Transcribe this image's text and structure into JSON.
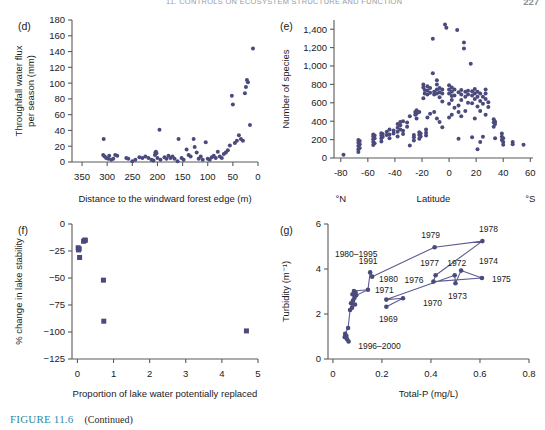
{
  "page": {
    "running_head": "11. CONTROLS ON ECOSYSTEM STRUCTURE AND FUNCTION",
    "page_number": "227"
  },
  "caption": {
    "figure_number": "FIGURE 11.6",
    "text": "(Continued)"
  },
  "style": {
    "marker_color": "#4a4a7d",
    "line_color": "#5b5b93",
    "axis_color": "#5a5a5a",
    "text_color": "#1a1a1a",
    "caption_accent": "#2d8aa8"
  },
  "chart_data": [
    {
      "id": "d",
      "panel_label": "(d)",
      "type": "scatter",
      "title": "",
      "xlabel": "Distance to the windward forest edge (m)",
      "ylabel": "Throughfall water flux per season (mm)",
      "ylabel_lines": [
        "Throughfall water flux",
        "per season (mm)"
      ],
      "xlim": [
        370,
        0
      ],
      "ylim": [
        0,
        180
      ],
      "x_reversed": true,
      "xticks": [
        350,
        300,
        250,
        200,
        150,
        100,
        50,
        0
      ],
      "yticks": [
        0,
        20,
        40,
        60,
        80,
        100,
        120,
        140,
        160,
        180
      ],
      "grid": false,
      "points": [
        [
          307,
          29
        ],
        [
          308,
          9
        ],
        [
          305,
          7
        ],
        [
          302,
          5
        ],
        [
          298,
          4
        ],
        [
          296,
          8
        ],
        [
          292,
          3
        ],
        [
          288,
          4
        ],
        [
          284,
          9
        ],
        [
          280,
          8
        ],
        [
          262,
          5
        ],
        [
          258,
          4
        ],
        [
          250,
          1
        ],
        [
          244,
          3
        ],
        [
          236,
          6
        ],
        [
          230,
          5
        ],
        [
          224,
          7
        ],
        [
          218,
          5
        ],
        [
          212,
          3
        ],
        [
          208,
          2
        ],
        [
          205,
          9
        ],
        [
          204,
          12
        ],
        [
          203,
          13
        ],
        [
          202,
          11
        ],
        [
          200,
          5
        ],
        [
          196,
          41
        ],
        [
          194,
          3
        ],
        [
          186,
          6
        ],
        [
          182,
          4
        ],
        [
          178,
          8
        ],
        [
          174,
          5
        ],
        [
          170,
          7
        ],
        [
          166,
          4
        ],
        [
          160,
          1
        ],
        [
          158,
          29
        ],
        [
          152,
          5
        ],
        [
          148,
          3
        ],
        [
          142,
          16
        ],
        [
          138,
          9
        ],
        [
          134,
          7
        ],
        [
          128,
          29
        ],
        [
          126,
          19
        ],
        [
          122,
          12
        ],
        [
          118,
          4
        ],
        [
          114,
          7
        ],
        [
          110,
          3
        ],
        [
          104,
          25
        ],
        [
          100,
          4
        ],
        [
          96,
          3
        ],
        [
          92,
          6
        ],
        [
          88,
          8
        ],
        [
          84,
          5
        ],
        [
          80,
          13
        ],
        [
          76,
          7
        ],
        [
          72,
          5
        ],
        [
          68,
          10
        ],
        [
          64,
          12
        ],
        [
          60,
          15
        ],
        [
          56,
          21
        ],
        [
          52,
          84
        ],
        [
          50,
          73
        ],
        [
          46,
          24
        ],
        [
          42,
          27
        ],
        [
          38,
          34
        ],
        [
          34,
          29
        ],
        [
          30,
          27
        ],
        [
          26,
          87
        ],
        [
          24,
          95
        ],
        [
          22,
          104
        ],
        [
          20,
          101
        ],
        [
          16,
          47
        ],
        [
          10,
          144
        ]
      ]
    },
    {
      "id": "e",
      "panel_label": "(e)",
      "type": "scatter",
      "title": "",
      "xlabel": "Latitude",
      "ylabel": "Number of species",
      "xlabel_left": "°N",
      "xlabel_right": "°S",
      "xlim": [
        -85,
        62
      ],
      "ylim": [
        0,
        1500
      ],
      "xticks": [
        -80,
        -60,
        -40,
        -20,
        0,
        20,
        40,
        60
      ],
      "yticks": [
        0,
        200,
        400,
        600,
        800,
        1000,
        1200,
        1400
      ],
      "ytick_labels": [
        "0",
        "200",
        "400",
        "600",
        "800",
        "1,000",
        "1,200",
        "1,400"
      ],
      "grid": false,
      "points": [
        [
          -78,
          35
        ],
        [
          -67,
          65
        ],
        [
          -67,
          95
        ],
        [
          -67,
          130
        ],
        [
          -67,
          165
        ],
        [
          -67,
          195
        ],
        [
          -66,
          110
        ],
        [
          -66,
          150
        ],
        [
          -66,
          185
        ],
        [
          -56,
          140
        ],
        [
          -56,
          175
        ],
        [
          -56,
          205
        ],
        [
          -56,
          235
        ],
        [
          -56,
          255
        ],
        [
          -55,
          160
        ],
        [
          -55,
          215
        ],
        [
          -55,
          245
        ],
        [
          -50,
          180
        ],
        [
          -50,
          215
        ],
        [
          -50,
          245
        ],
        [
          -50,
          270
        ],
        [
          -49,
          230
        ],
        [
          -49,
          260
        ],
        [
          -46,
          250
        ],
        [
          -46,
          285
        ],
        [
          -44,
          215
        ],
        [
          -44,
          255
        ],
        [
          -44,
          310
        ],
        [
          -41,
          265
        ],
        [
          -41,
          300
        ],
        [
          -38,
          235
        ],
        [
          -38,
          285
        ],
        [
          -38,
          330
        ],
        [
          -38,
          370
        ],
        [
          -36,
          310
        ],
        [
          -36,
          355
        ],
        [
          -36,
          390
        ],
        [
          -34,
          260
        ],
        [
          -34,
          295
        ],
        [
          -34,
          400
        ],
        [
          -31,
          340
        ],
        [
          -31,
          385
        ],
        [
          -29,
          135
        ],
        [
          -29,
          455
        ],
        [
          -26,
          190
        ],
        [
          -26,
          225
        ],
        [
          -26,
          250
        ],
        [
          -25,
          470
        ],
        [
          -25,
          500
        ],
        [
          -24,
          430
        ],
        [
          -24,
          480
        ],
        [
          -24,
          520
        ],
        [
          -22,
          210
        ],
        [
          -22,
          250
        ],
        [
          -22,
          280
        ],
        [
          -22,
          500
        ],
        [
          -21,
          235
        ],
        [
          -21,
          265
        ],
        [
          -19,
          650
        ],
        [
          -19,
          765
        ],
        [
          -19,
          800
        ],
        [
          -18,
          700
        ],
        [
          -18,
          740
        ],
        [
          -17,
          245
        ],
        [
          -17,
          275
        ],
        [
          -17,
          310
        ],
        [
          -16,
          440
        ],
        [
          -16,
          690
        ],
        [
          -16,
          735
        ],
        [
          -16,
          780
        ],
        [
          -14,
          480
        ],
        [
          -14,
          710
        ],
        [
          -14,
          760
        ],
        [
          -12,
          920
        ],
        [
          -12,
          1295
        ],
        [
          -11,
          500
        ],
        [
          -11,
          690
        ],
        [
          -11,
          720
        ],
        [
          -9,
          430
        ],
        [
          -9,
          700
        ],
        [
          -9,
          745
        ],
        [
          -9,
          800
        ],
        [
          -9,
          845
        ],
        [
          -7,
          390
        ],
        [
          -7,
          660
        ],
        [
          -7,
          715
        ],
        [
          -7,
          760
        ],
        [
          -5,
          335
        ],
        [
          -5,
          615
        ],
        [
          -5,
          700
        ],
        [
          -5,
          745
        ],
        [
          -3,
          1450
        ],
        [
          -2,
          1415
        ],
        [
          0,
          440
        ],
        [
          0,
          590
        ],
        [
          0,
          700
        ],
        [
          0,
          745
        ],
        [
          0,
          790
        ],
        [
          2,
          470
        ],
        [
          2,
          630
        ],
        [
          2,
          675
        ],
        [
          2,
          720
        ],
        [
          2,
          765
        ],
        [
          4,
          545
        ],
        [
          4,
          680
        ],
        [
          4,
          745
        ],
        [
          6,
          1390
        ],
        [
          7,
          210
        ],
        [
          7,
          500
        ],
        [
          7,
          570
        ],
        [
          7,
          715
        ],
        [
          9,
          455
        ],
        [
          9,
          630
        ],
        [
          9,
          690
        ],
        [
          9,
          740
        ],
        [
          11,
          1190
        ],
        [
          11,
          1255
        ],
        [
          12,
          510
        ],
        [
          12,
          665
        ],
        [
          12,
          720
        ],
        [
          14,
          600
        ],
        [
          14,
          690
        ],
        [
          14,
          730
        ],
        [
          16,
          1025
        ],
        [
          17,
          225
        ],
        [
          17,
          595
        ],
        [
          17,
          680
        ],
        [
          17,
          725
        ],
        [
          19,
          430
        ],
        [
          19,
          640
        ],
        [
          19,
          700
        ],
        [
          19,
          750
        ],
        [
          21,
          95
        ],
        [
          21,
          560
        ],
        [
          21,
          665
        ],
        [
          21,
          720
        ],
        [
          23,
          175
        ],
        [
          23,
          510
        ],
        [
          23,
          620
        ],
        [
          23,
          700
        ],
        [
          25,
          230
        ],
        [
          25,
          590
        ],
        [
          25,
          665
        ],
        [
          27,
          470
        ],
        [
          27,
          640
        ],
        [
          27,
          700
        ],
        [
          27,
          745
        ],
        [
          29,
          555
        ],
        [
          29,
          605
        ],
        [
          33,
          340
        ],
        [
          33,
          385
        ],
        [
          33,
          420
        ],
        [
          34,
          215
        ],
        [
          34,
          370
        ],
        [
          34,
          395
        ],
        [
          39,
          195
        ],
        [
          39,
          230
        ],
        [
          39,
          265
        ],
        [
          40,
          145
        ],
        [
          40,
          175
        ],
        [
          40,
          215
        ],
        [
          47,
          150
        ],
        [
          47,
          175
        ],
        [
          55,
          145
        ]
      ]
    },
    {
      "id": "f",
      "panel_label": "(f)",
      "type": "scatter",
      "title": "",
      "xlabel": "Proportion of lake water potentially replaced",
      "ylabel": "% change in lake stability",
      "xlim": [
        -0.15,
        5
      ],
      "ylim": [
        -125,
        0
      ],
      "xticks": [
        0,
        1,
        2,
        3,
        4,
        5
      ],
      "yticks": [
        -125,
        -100,
        -75,
        -50,
        -25,
        0
      ],
      "ytick_labels": [
        "−125",
        "−100",
        "−75",
        "−50",
        "−25",
        "0"
      ],
      "grid": false,
      "marker": "square",
      "points": [
        [
          0.02,
          -22
        ],
        [
          0.03,
          -24
        ],
        [
          0.05,
          -23
        ],
        [
          0.06,
          -31
        ],
        [
          0.17,
          -16
        ],
        [
          0.2,
          -15
        ],
        [
          0.22,
          -15
        ],
        [
          0.72,
          -52
        ],
        [
          0.73,
          -90
        ],
        [
          4.68,
          -99
        ]
      ]
    },
    {
      "id": "g",
      "panel_label": "(g)",
      "type": "line",
      "title": "",
      "xlabel": "Total-P (mg/L)",
      "ylabel": "Turbidity (m⁻¹)",
      "xlim": [
        -0.02,
        0.8
      ],
      "ylim": [
        0,
        6
      ],
      "xticks": [
        0,
        0.2,
        0.4,
        0.6,
        0.8
      ],
      "xtick_labels": [
        "0",
        "0.2",
        "0.4",
        "0.6",
        "0.8"
      ],
      "yticks": [
        0,
        2,
        4,
        6
      ],
      "grid": false,
      "trajectory": [
        {
          "year": "1969",
          "x": 0.218,
          "y": 2.32,
          "label_dx": 2,
          "label_dy": 15,
          "label_anchor": "middle"
        },
        {
          "year": "1970",
          "x": 0.286,
          "y": 2.7,
          "label_dx": 20,
          "label_dy": 8,
          "label_anchor": "start"
        },
        {
          "year": "1971",
          "x": 0.218,
          "y": 2.64,
          "label_dx": -2,
          "label_dy": -7,
          "label_anchor": "middle"
        },
        {
          "year": "1972",
          "x": 0.497,
          "y": 3.72,
          "label_dx": 2,
          "label_dy": -9,
          "label_anchor": "middle"
        },
        {
          "year": "1973",
          "x": 0.5,
          "y": 3.37,
          "label_dx": 2,
          "label_dy": 16,
          "label_anchor": "middle"
        },
        {
          "year": "1974",
          "x": 0.523,
          "y": 3.93,
          "label_dx": 18,
          "label_dy": -7,
          "label_anchor": "start"
        },
        {
          "year": "1975",
          "x": 0.608,
          "y": 3.6,
          "label_dx": 10,
          "label_dy": 4,
          "label_anchor": "start"
        },
        {
          "year": "1976",
          "x": 0.41,
          "y": 3.44,
          "label_dx": -10,
          "label_dy": 1,
          "label_anchor": "end"
        },
        {
          "year": "1977",
          "x": 0.419,
          "y": 3.72,
          "label_dx": -6,
          "label_dy": -9,
          "label_anchor": "middle"
        },
        {
          "year": "1978",
          "x": 0.61,
          "y": 5.24,
          "label_dx": 6,
          "label_dy": -9,
          "label_anchor": "middle"
        },
        {
          "year": "1979",
          "x": 0.415,
          "y": 4.97,
          "label_dx": -4,
          "label_dy": -9,
          "label_anchor": "middle"
        },
        {
          "year": "1980",
          "x": 0.16,
          "y": 3.66,
          "label_dx": 7,
          "label_dy": 5,
          "label_anchor": "start"
        },
        {
          "year": "1991",
          "x": 0.152,
          "y": 3.85,
          "label_dx": -2,
          "label_dy": -8,
          "label_anchor": "middle"
        }
      ],
      "cluster_1980_1995": [
        [
          0.086,
          3.02
        ],
        [
          0.092,
          2.97
        ],
        [
          0.08,
          2.88
        ],
        [
          0.095,
          2.83
        ],
        [
          0.088,
          2.72
        ],
        [
          0.082,
          2.6
        ],
        [
          0.074,
          2.48
        ],
        [
          0.09,
          2.42
        ],
        [
          0.078,
          2.28
        ],
        [
          0.07,
          2.18
        ],
        [
          0.143,
          3.08
        ]
      ],
      "cluster_1996_2000": [
        [
          0.05,
          1.12
        ],
        [
          0.062,
          1.38
        ],
        [
          0.055,
          1.02
        ],
        [
          0.048,
          0.98
        ],
        [
          0.058,
          0.88
        ],
        [
          0.064,
          0.78
        ]
      ],
      "annotations": [
        {
          "text": "1980–1995",
          "x": 0.095,
          "y": 4.52,
          "anchor": "middle"
        },
        {
          "text": "1996–2000",
          "x": 0.19,
          "y": 0.45,
          "anchor": "middle"
        }
      ]
    }
  ]
}
